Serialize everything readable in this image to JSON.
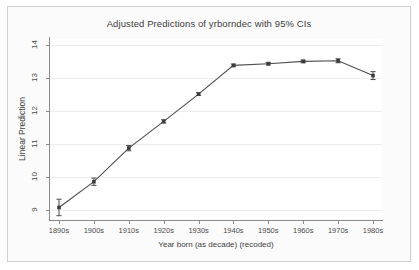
{
  "chart_data": {
    "type": "line",
    "title": "Adjusted Predictions of yrborndec with 95% CIs",
    "xlabel": "Year born (as decade) (recoded)",
    "ylabel": "Linear Prediction",
    "categories": [
      "1890s",
      "1900s",
      "1910s",
      "1920s",
      "1930s",
      "1940s",
      "1950s",
      "1960s",
      "1970s",
      "1980s"
    ],
    "values": [
      9.07,
      9.85,
      10.87,
      11.68,
      12.51,
      13.38,
      13.43,
      13.5,
      13.52,
      13.07
    ],
    "ci_lower": [
      8.82,
      9.74,
      10.79,
      11.63,
      12.47,
      13.34,
      13.39,
      13.46,
      13.46,
      12.95
    ],
    "ci_upper": [
      9.32,
      9.96,
      10.95,
      11.73,
      12.55,
      13.42,
      13.47,
      13.54,
      13.58,
      13.19
    ],
    "ylim": [
      8.72,
      14.18
    ],
    "yticks": [
      9,
      10,
      11,
      12,
      13,
      14
    ],
    "ytick_labels": [
      "9",
      "10",
      "11",
      "12",
      "13",
      "14"
    ],
    "grid": true,
    "legend": "none",
    "series": [
      {
        "name": "Linear Prediction",
        "marker": "square",
        "color": "#4d4d4d",
        "values": [
          9.07,
          9.85,
          10.87,
          11.68,
          12.51,
          13.38,
          13.43,
          13.5,
          13.52,
          13.07
        ]
      }
    ],
    "ci_level": "95%"
  },
  "colors": {
    "line": "#4d4d4d",
    "marker": "#3c3c3c",
    "error_bar": "#4d4d4d",
    "grid": "#ededed",
    "axis": "#8a8a8a",
    "text": "#3b3b3b",
    "frame": "#cfcfcf",
    "outer_background": "#fbfbfb",
    "plot_background": "#ffffff"
  }
}
